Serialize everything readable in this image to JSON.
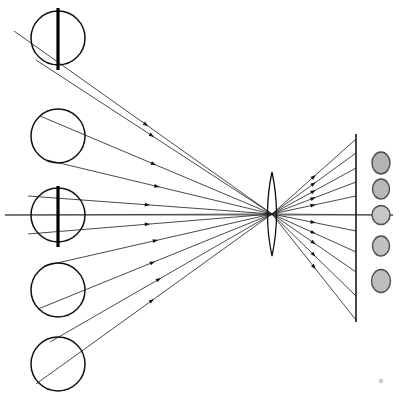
{
  "figure": {
    "background_color": "#ffffff",
    "stroke_color": "#111111",
    "width": 399,
    "height": 398
  },
  "optical_axis": {
    "name": "optical-axis",
    "x1": 5,
    "y1": 215,
    "x2": 393,
    "y2": 215,
    "color": "#3a3a3a"
  },
  "lens": {
    "name": "biconvex-lens",
    "center_x": 272,
    "center_y": 214,
    "half_height": 42,
    "half_width": 9,
    "color": "#101010"
  },
  "focal_point": {
    "name": "convergence-point",
    "x": 272,
    "y": 214
  },
  "screen": {
    "name": "image-screen",
    "x": 356,
    "y_top": 134,
    "y_bottom": 322,
    "color": "#1a1a1a"
  },
  "objects": [
    {
      "id": "object-1",
      "cx": 58,
      "cy": 38,
      "r": 27,
      "has_bar": true,
      "bar_top": 8,
      "bar_bottom": 70,
      "bar_x": 58
    },
    {
      "id": "object-2",
      "cx": 58,
      "cy": 136,
      "r": 27,
      "has_bar": false,
      "bar_top": 0,
      "bar_bottom": 0,
      "bar_x": 0
    },
    {
      "id": "object-3",
      "cx": 58,
      "cy": 215,
      "r": 27,
      "has_bar": true,
      "bar_top": 186,
      "bar_bottom": 247,
      "bar_x": 58
    },
    {
      "id": "object-4",
      "cx": 58,
      "cy": 290,
      "r": 27,
      "has_bar": false,
      "bar_top": 0,
      "bar_bottom": 0,
      "bar_x": 0
    },
    {
      "id": "object-5",
      "cx": 58,
      "cy": 364,
      "r": 27,
      "has_bar": false,
      "bar_top": 0,
      "bar_bottom": 0,
      "bar_x": 0
    }
  ],
  "images": [
    {
      "id": "image-blob-1",
      "cx": 381,
      "cy": 163,
      "rx": 9,
      "ry": 11,
      "fill": "#b3b3b3"
    },
    {
      "id": "image-blob-2",
      "cx": 381,
      "cy": 189,
      "rx": 8.5,
      "ry": 10,
      "fill": "#b8b8b8"
    },
    {
      "id": "image-blob-3",
      "cx": 381,
      "cy": 215,
      "rx": 9,
      "ry": 9.5,
      "fill": "#c6c6c6"
    },
    {
      "id": "image-blob-4",
      "cx": 381,
      "cy": 246,
      "rx": 8.5,
      "ry": 10,
      "fill": "#c0c0c0"
    },
    {
      "id": "image-blob-5",
      "cx": 381,
      "cy": 281,
      "rx": 9.5,
      "ry": 11.5,
      "fill": "#bdbdbd"
    }
  ],
  "object_rays": [
    {
      "id": "ray-obj1-upper",
      "x1": 14,
      "y1": 31,
      "x2": 272,
      "y2": 214,
      "arrow_t": 0.52
    },
    {
      "id": "ray-obj1-lower",
      "x1": 36,
      "y1": 60,
      "x2": 272,
      "y2": 214,
      "arrow_t": 0.5
    },
    {
      "id": "ray-obj2-upper",
      "x1": 40,
      "y1": 116,
      "x2": 272,
      "y2": 214,
      "arrow_t": 0.5
    },
    {
      "id": "ray-obj2-lower",
      "x1": 47,
      "y1": 160,
      "x2": 272,
      "y2": 214,
      "arrow_t": 0.5
    },
    {
      "id": "ray-obj3-upper",
      "x1": 28,
      "y1": 196,
      "x2": 272,
      "y2": 214,
      "arrow_t": 0.5
    },
    {
      "id": "ray-obj3-axis",
      "x1": 5,
      "y1": 215,
      "x2": 272,
      "y2": 214,
      "arrow_t": 0.0
    },
    {
      "id": "ray-obj3-lower",
      "x1": 28,
      "y1": 234,
      "x2": 272,
      "y2": 214,
      "arrow_t": 0.5
    },
    {
      "id": "ray-obj4-upper",
      "x1": 44,
      "y1": 266,
      "x2": 272,
      "y2": 214,
      "arrow_t": 0.5
    },
    {
      "id": "ray-obj4-lower",
      "x1": 38,
      "y1": 309,
      "x2": 272,
      "y2": 214,
      "arrow_t": 0.5
    },
    {
      "id": "ray-obj5-upper",
      "x1": 50,
      "y1": 342,
      "x2": 272,
      "y2": 214,
      "arrow_t": 0.5
    },
    {
      "id": "ray-obj5-lower",
      "x1": 36,
      "y1": 384,
      "x2": 272,
      "y2": 214,
      "arrow_t": 0.5
    }
  ],
  "image_rays": [
    {
      "id": "ray-img1-a",
      "x1": 272,
      "y1": 214,
      "x2": 356,
      "y2": 139,
      "arrow_t": 0.52
    },
    {
      "id": "ray-img1-b",
      "x1": 272,
      "y1": 214,
      "x2": 356,
      "y2": 153,
      "arrow_t": 0.52
    },
    {
      "id": "ray-img2-a",
      "x1": 272,
      "y1": 214,
      "x2": 356,
      "y2": 168,
      "arrow_t": 0.52
    },
    {
      "id": "ray-img2-b",
      "x1": 272,
      "y1": 214,
      "x2": 356,
      "y2": 182,
      "arrow_t": 0.52
    },
    {
      "id": "ray-img3-a",
      "x1": 272,
      "y1": 214,
      "x2": 356,
      "y2": 196,
      "arrow_t": 0.52
    },
    {
      "id": "ray-img3-axis",
      "x1": 272,
      "y1": 214,
      "x2": 393,
      "y2": 215,
      "arrow_t": 0.0
    },
    {
      "id": "ray-img3-b",
      "x1": 272,
      "y1": 214,
      "x2": 356,
      "y2": 231,
      "arrow_t": 0.52
    },
    {
      "id": "ray-img4-a",
      "x1": 272,
      "y1": 214,
      "x2": 356,
      "y2": 252,
      "arrow_t": 0.52
    },
    {
      "id": "ray-img4-b",
      "x1": 272,
      "y1": 214,
      "x2": 356,
      "y2": 272,
      "arrow_t": 0.52
    },
    {
      "id": "ray-img5-a",
      "x1": 272,
      "y1": 214,
      "x2": 356,
      "y2": 296,
      "arrow_t": 0.52
    },
    {
      "id": "ray-img5-b",
      "x1": 272,
      "y1": 214,
      "x2": 356,
      "y2": 320,
      "arrow_t": 0.52
    }
  ],
  "speck": {
    "name": "corner-speck",
    "cx": 381,
    "cy": 381,
    "r": 2.4,
    "fill": "#cfcfcf"
  }
}
